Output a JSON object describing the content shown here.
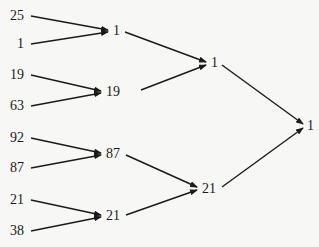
{
  "diagram": {
    "type": "tournament-tree",
    "leaves": [
      "25",
      "1",
      "19",
      "63",
      "92",
      "87",
      "21",
      "38"
    ],
    "level1": [
      "1",
      "19",
      "87",
      "21"
    ],
    "level2": [
      "1",
      "21"
    ],
    "root": "1"
  }
}
